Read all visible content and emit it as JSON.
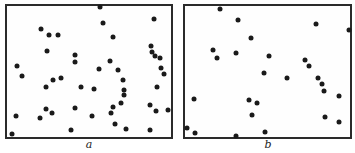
{
  "panels": [
    {
      "id": "a",
      "label": "a",
      "frame": {
        "x": 5,
        "y": 4,
        "w": 168,
        "h": 135
      },
      "points": [
        [
          100,
          7
        ],
        [
          154,
          19
        ],
        [
          103,
          23
        ],
        [
          41,
          29
        ],
        [
          49,
          35
        ],
        [
          58,
          35
        ],
        [
          113,
          37
        ],
        [
          47,
          51
        ],
        [
          75,
          55
        ],
        [
          75,
          62
        ],
        [
          151,
          46
        ],
        [
          152,
          52
        ],
        [
          155,
          56
        ],
        [
          160,
          58
        ],
        [
          17,
          66
        ],
        [
          110,
          61
        ],
        [
          99,
          69
        ],
        [
          118,
          70
        ],
        [
          161,
          68
        ],
        [
          164,
          74
        ],
        [
          22,
          76
        ],
        [
          53,
          80
        ],
        [
          61,
          78
        ],
        [
          46,
          87
        ],
        [
          81,
          87
        ],
        [
          94,
          89
        ],
        [
          123,
          80
        ],
        [
          124,
          90
        ],
        [
          124,
          95
        ],
        [
          157,
          87
        ],
        [
          121,
          103
        ],
        [
          113,
          107
        ],
        [
          150,
          105
        ],
        [
          75,
          108
        ],
        [
          46,
          109
        ],
        [
          52,
          113
        ],
        [
          16,
          116
        ],
        [
          40,
          118
        ],
        [
          111,
          113
        ],
        [
          168,
          110
        ],
        [
          92,
          116
        ],
        [
          156,
          111
        ],
        [
          115,
          124
        ],
        [
          126,
          129
        ],
        [
          71,
          130
        ],
        [
          150,
          130
        ],
        [
          12,
          134
        ]
      ]
    },
    {
      "id": "b",
      "label": "b",
      "frame": {
        "x": 183,
        "y": 4,
        "w": 169,
        "h": 135
      },
      "points": [
        [
          220,
          9
        ],
        [
          238,
          20
        ],
        [
          316,
          24
        ],
        [
          349,
          30
        ],
        [
          251,
          38
        ],
        [
          213,
          50
        ],
        [
          236,
          53
        ],
        [
          217,
          58
        ],
        [
          269,
          56
        ],
        [
          305,
          60
        ],
        [
          309,
          66
        ],
        [
          264,
          73
        ],
        [
          287,
          78
        ],
        [
          318,
          78
        ],
        [
          322,
          84
        ],
        [
          324,
          91
        ],
        [
          339,
          96
        ],
        [
          194,
          99
        ],
        [
          249,
          100
        ],
        [
          257,
          103
        ],
        [
          252,
          115
        ],
        [
          325,
          117
        ],
        [
          339,
          122
        ],
        [
          187,
          128
        ],
        [
          195,
          133
        ],
        [
          265,
          132
        ],
        [
          236,
          136
        ]
      ]
    }
  ],
  "labels": [
    {
      "text": "a",
      "x": 89,
      "y": 138
    },
    {
      "text": "b",
      "x": 268,
      "y": 138
    }
  ]
}
